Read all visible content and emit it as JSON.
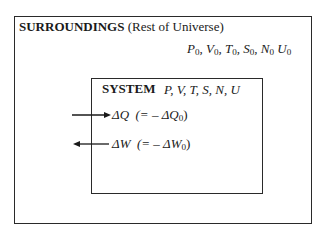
{
  "surroundings": {
    "title_bold": "SURROUNDINGS",
    "title_paren": " (Rest of Universe)",
    "variables": [
      {
        "sym": "P",
        "sub": "0",
        "sep": ", "
      },
      {
        "sym": "V",
        "sub": "0",
        "sep": ", "
      },
      {
        "sym": "T",
        "sub": "0",
        "sep": ", "
      },
      {
        "sym": "S",
        "sub": "0",
        "sep": ", "
      },
      {
        "sym": "N",
        "sub": "0",
        "sep": " "
      },
      {
        "sym": "U",
        "sub": "0",
        "sep": ""
      }
    ]
  },
  "system": {
    "title": "SYSTEM",
    "variables": "P, V, T, S, N, U"
  },
  "flows": {
    "heat": {
      "label": "ΔQ",
      "relation_prefix": "(= – ΔQ",
      "relation_sub": "0",
      "relation_suffix": ")",
      "direction": "in"
    },
    "work": {
      "label": "ΔW",
      "relation_prefix": "(= – ΔW",
      "relation_sub": "0",
      "relation_suffix": ")",
      "direction": "out"
    }
  }
}
